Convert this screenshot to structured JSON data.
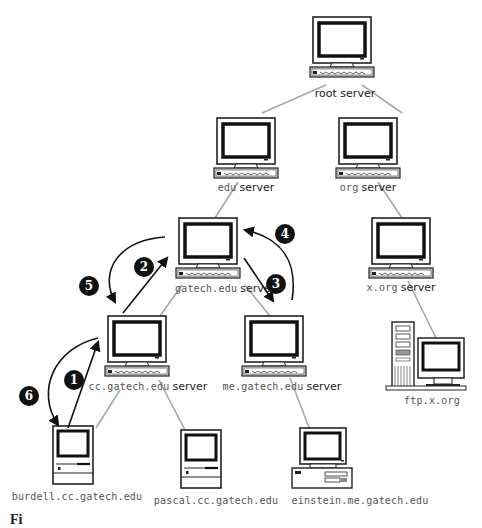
{
  "diagram": {
    "type": "DNS hierarchy name resolution",
    "nodes": [
      {
        "id": "root",
        "name_mono": "",
        "name_sans": "root server",
        "icon": "server-monitor"
      },
      {
        "id": "edu",
        "name_mono": "edu",
        "name_sans": "server",
        "icon": "server-monitor"
      },
      {
        "id": "org",
        "name_mono": "org",
        "name_sans": "server",
        "icon": "server-monitor"
      },
      {
        "id": "gatech",
        "name_mono": "gatech.edu",
        "name_sans": "server",
        "icon": "server-monitor"
      },
      {
        "id": "xorg",
        "name_mono": "x.org",
        "name_sans": "server",
        "icon": "server-monitor"
      },
      {
        "id": "cc",
        "name_mono": "cc.gatech.edu",
        "name_sans": "server",
        "icon": "server-monitor"
      },
      {
        "id": "me",
        "name_mono": "me.gatech.edu",
        "name_sans": "server",
        "icon": "server-monitor"
      },
      {
        "id": "ftp",
        "name_mono": "ftp.x.org",
        "name_sans": "",
        "icon": "tower-workstation"
      },
      {
        "id": "burdell",
        "name_mono": "burdell.cc.gatech.edu",
        "name_sans": "",
        "icon": "compact-mac"
      },
      {
        "id": "pascal",
        "name_mono": "pascal.cc.gatech.edu",
        "name_sans": "",
        "icon": "compact-mac"
      },
      {
        "id": "einstein",
        "name_mono": "einstein.me.gatech.edu",
        "name_sans": "",
        "icon": "desktop-pc"
      }
    ],
    "edges": [
      [
        "root",
        "edu"
      ],
      [
        "root",
        "org"
      ],
      [
        "edu",
        "gatech"
      ],
      [
        "org",
        "xorg"
      ],
      [
        "gatech",
        "cc"
      ],
      [
        "gatech",
        "me"
      ],
      [
        "xorg",
        "ftp"
      ],
      [
        "cc",
        "burdell"
      ],
      [
        "cc",
        "pascal"
      ],
      [
        "me",
        "einstein"
      ]
    ],
    "steps": [
      {
        "n": "1",
        "from": "burdell",
        "to": "cc"
      },
      {
        "n": "2",
        "from": "cc",
        "to": "gatech"
      },
      {
        "n": "3",
        "from": "gatech",
        "to": "me"
      },
      {
        "n": "4",
        "from": "me",
        "to": "gatech"
      },
      {
        "n": "5",
        "from": "gatech",
        "to": "cc"
      },
      {
        "n": "6",
        "from": "cc",
        "to": "burdell"
      }
    ],
    "caption_fragment": "Fi"
  },
  "colors": {
    "edge": "#a8a8a8",
    "arrow": "#111111",
    "badge_bg": "#111111",
    "badge_fg": "#ffffff"
  }
}
